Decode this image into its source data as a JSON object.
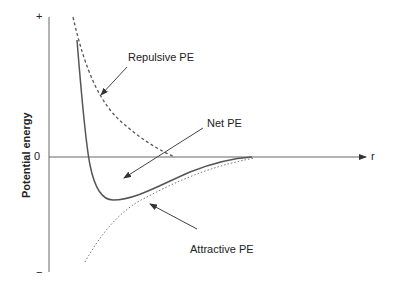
{
  "diagram": {
    "y_axis": {
      "label": "Potential energy",
      "top_tick": "+",
      "bottom_tick": "−",
      "zero_tick": "0"
    },
    "x_axis": {
      "label": "r"
    },
    "curves": [
      {
        "name": "Repulsive PE",
        "style": "dashed"
      },
      {
        "name": "Net PE",
        "style": "solid"
      },
      {
        "name": "Attractive PE",
        "style": "dotted"
      }
    ],
    "annotations": {
      "repulsive": "Repulsive PE",
      "net": "Net PE",
      "attractive": "Attractive PE"
    },
    "colors": {
      "axis": "#555555",
      "curve": "#555555",
      "text": "#222222"
    }
  }
}
